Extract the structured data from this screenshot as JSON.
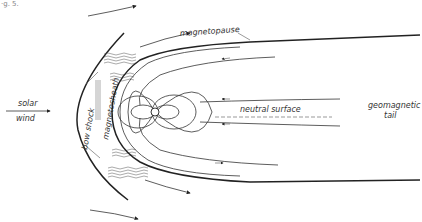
{
  "caption_fragment": "·g. 5.",
  "labels": {
    "solar_wind_line1": "solar",
    "solar_wind_line2": "wind",
    "bow_shock": "bow shock",
    "magnetosheath": "magnetosheath",
    "magnetopause": "magnetopause",
    "neutral_surface": "neutral surface",
    "geomagnetic_tail_line1": "geomagnetic",
    "geomagnetic_tail_line2": "tail"
  },
  "colors": {
    "line": "#333333",
    "background": "#ffffff"
  }
}
